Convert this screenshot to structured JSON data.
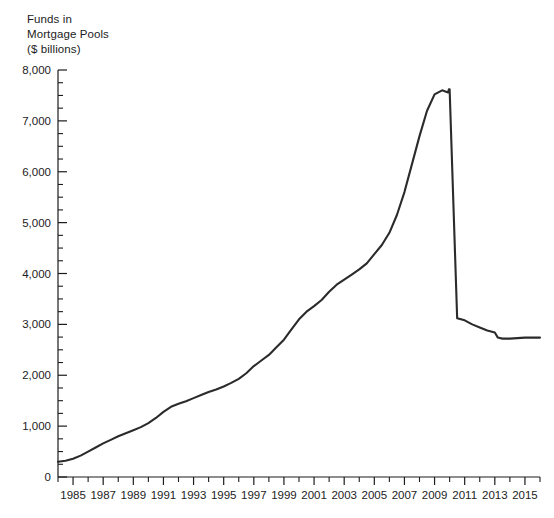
{
  "chart_data": {
    "type": "line",
    "title": "Funds in\nMortgage Pools\n($ billions)",
    "title_lines": [
      "Funds in",
      "Mortgage Pools",
      "($ billions)"
    ],
    "xlabel": "",
    "ylabel": "Funds in Mortgage Pools ($ billions)",
    "xlim": [
      1984,
      2016
    ],
    "ylim": [
      0,
      8000
    ],
    "grid": false,
    "legend": "none",
    "line_color": "#2b2b2b",
    "y_ticks_major": [
      0,
      1000,
      2000,
      3000,
      4000,
      5000,
      6000,
      7000,
      8000
    ],
    "y_tick_labels": [
      "0",
      "1,000",
      "2,000",
      "3,000",
      "4,000",
      "5,000",
      "6,000",
      "7,000",
      "8,000"
    ],
    "y_tick_minor_step": 250,
    "x_ticks_major": [
      1985,
      1987,
      1989,
      1991,
      1993,
      1995,
      1997,
      1999,
      2001,
      2003,
      2005,
      2007,
      2009,
      2011,
      2013,
      2015
    ],
    "x_tick_labels": [
      "1985",
      "1987",
      "1989",
      "1991",
      "1993",
      "1995",
      "1997",
      "1999",
      "2001",
      "2003",
      "2005",
      "2007",
      "2009",
      "2011",
      "2013",
      "2015"
    ],
    "x_tick_minor_step": 1,
    "series": [
      {
        "name": "Funds in Mortgage Pools",
        "x": [
          1984,
          1984.5,
          1985,
          1985.5,
          1986,
          1986.5,
          1987,
          1987.5,
          1988,
          1988.5,
          1989,
          1989.5,
          1990,
          1990.5,
          1991,
          1991.5,
          1992,
          1992.5,
          1993,
          1993.5,
          1994,
          1994.5,
          1995,
          1995.5,
          1996,
          1996.5,
          1997,
          1997.5,
          1998,
          1998.5,
          1999,
          1999.5,
          2000,
          2000.5,
          2001,
          2001.5,
          2002,
          2002.5,
          2003,
          2003.5,
          2004,
          2004.5,
          2005,
          2005.5,
          2006,
          2006.5,
          2007,
          2007.5,
          2008,
          2008.5,
          2009,
          2009.5,
          2009.9,
          2009.95,
          2010,
          2010.5,
          2011,
          2011.5,
          2012,
          2012.5,
          2013,
          2013.2,
          2013.5,
          2014,
          2014.5,
          2015,
          2015.5,
          2016
        ],
        "values": [
          300,
          320,
          360,
          420,
          500,
          580,
          660,
          730,
          800,
          860,
          920,
          980,
          1060,
          1160,
          1280,
          1380,
          1440,
          1490,
          1550,
          1610,
          1670,
          1720,
          1780,
          1850,
          1930,
          2040,
          2180,
          2290,
          2400,
          2550,
          2700,
          2900,
          3100,
          3250,
          3360,
          3480,
          3640,
          3780,
          3880,
          3980,
          4080,
          4200,
          4380,
          4560,
          4800,
          5150,
          5600,
          6150,
          6700,
          7200,
          7520,
          7600,
          7560,
          7620,
          7620,
          3120,
          3080,
          3000,
          2940,
          2880,
          2840,
          2740,
          2720,
          2720,
          2730,
          2740,
          2740,
          2740
        ],
        "annotations": [
          {
            "label": "peak plateau",
            "x": 2009.5,
            "y": 7600
          },
          {
            "label": "sharp drop (series break)",
            "x": 2010,
            "y": 3120
          },
          {
            "label": "start",
            "x": 1984,
            "y": 300
          }
        ]
      }
    ]
  }
}
